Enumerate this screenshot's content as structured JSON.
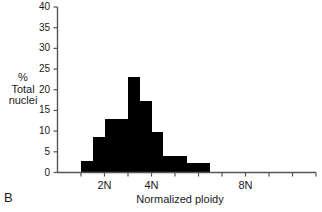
{
  "panel": {
    "label": "B"
  },
  "axes": {
    "ylabel": "%\nTotal\nnuclei",
    "xlabel": "Normalized ploidy",
    "ylabel_line1": "%",
    "ylabel_line2": "Total",
    "ylabel_line3": "nuclei"
  },
  "chart_data": {
    "type": "bar",
    "title": "",
    "subtitle": "",
    "xlabel": "Normalized ploidy",
    "ylabel": "% Total nuclei",
    "ylim": [
      0,
      40
    ],
    "yticks": [
      0,
      5,
      10,
      15,
      20,
      25,
      30,
      35,
      40
    ],
    "ytick_labels": [
      "0",
      "5",
      "10",
      "15",
      "20",
      "25",
      "30",
      "35",
      "40"
    ],
    "xlim": [
      0,
      11
    ],
    "xticks": [
      1,
      2,
      3,
      4,
      5,
      6,
      7,
      8,
      9,
      10,
      11
    ],
    "xtick_labels": [
      "",
      "2N",
      "",
      "4N",
      "",
      "",
      "",
      "8N",
      "",
      "",
      ""
    ],
    "xtick_label_positions": [
      2,
      4,
      8
    ],
    "xtick_label_texts": [
      "2N",
      "4N",
      "8N"
    ],
    "grid": false,
    "legend": null,
    "bar_color": "#000000",
    "categories": [
      "1.0-1.5",
      "1.5-2.0",
      "2.0-2.5",
      "2.5-3.0",
      "3.0-3.5",
      "3.5-4.0",
      "4.0-4.5",
      "4.5-5.0",
      "5.0-5.5",
      "5.5-6.0",
      "6.0-6.5"
    ],
    "bin_edges": [
      1.0,
      1.5,
      2.0,
      2.5,
      3.0,
      3.5,
      4.0,
      4.5,
      5.0,
      5.5,
      6.0,
      6.5
    ],
    "values": [
      2.7,
      8.5,
      13.0,
      13.0,
      23.0,
      17.2,
      9.8,
      4.0,
      4.0,
      2.4,
      2.4
    ],
    "series": [
      {
        "name": "% Total nuclei",
        "values": [
          2.7,
          8.5,
          13.0,
          13.0,
          23.0,
          17.2,
          9.8,
          4.0,
          4.0,
          2.4,
          2.4
        ]
      }
    ],
    "annotations": []
  }
}
